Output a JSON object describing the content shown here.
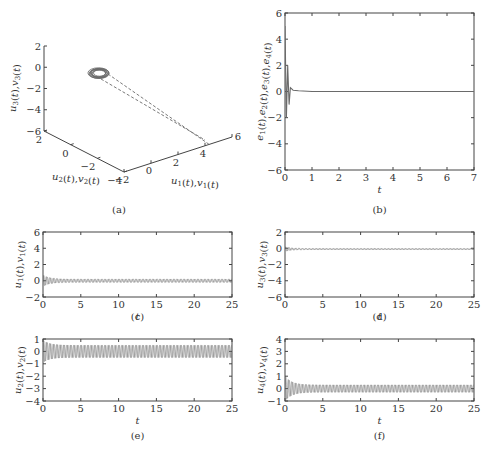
{
  "figure": {
    "background": "#ffffff",
    "axis_color": "#444444",
    "trace_color": "#6a6a6a",
    "panels": [
      "(a)",
      "(b)",
      "(c)",
      "(d)",
      "(e)",
      "(f)"
    ]
  },
  "chart_data": [
    {
      "id": "a",
      "type": "line3d",
      "caption": "(a)",
      "xlabel": "u1(t),v1(t)",
      "ylabel": "u2(t),v2(t)",
      "zlabel": "u3(t),v3(t)",
      "x_ticks": [
        -2,
        0,
        2,
        4,
        6
      ],
      "y_ticks": [
        2,
        0,
        -2,
        -4
      ],
      "z_ticks": [
        2,
        0,
        -2,
        -4,
        -6
      ],
      "xlim": [
        -2,
        6
      ],
      "ylim": [
        -4,
        2
      ],
      "zlim": [
        -6,
        2
      ],
      "description": "Two trajectories start near (5, -3, -6) along dashed paths and converge to a small limit cycle (ring) near (-1, 0, -0.5)",
      "series": [
        {
          "name": "u(t)",
          "style": "dashed",
          "start": [
            5,
            -3,
            -6
          ],
          "attractor_center": [
            -1,
            0,
            -0.4
          ]
        },
        {
          "name": "v(t)",
          "style": "dashed",
          "start": [
            4.8,
            -3.2,
            -5.8
          ],
          "attractor_center": [
            -1,
            0,
            -0.4
          ]
        }
      ]
    },
    {
      "id": "b",
      "type": "line",
      "caption": "(b)",
      "xlabel": "t",
      "ylabel": "e1(t),e2(t),e3(t),e4(t)",
      "xlim": [
        0,
        7
      ],
      "ylim": [
        -6,
        6
      ],
      "x_ticks": [
        0,
        1,
        2,
        3,
        4,
        5,
        6,
        7
      ],
      "y_ticks": [
        -6,
        -4,
        -2,
        0,
        2,
        4,
        6
      ],
      "description": "Synchronization errors spike within t<0.3 (peak ~5, min ~-2) then settle to 0",
      "series": [
        {
          "name": "e(t)",
          "x": [
            0,
            0.05,
            0.1,
            0.15,
            0.2,
            0.3,
            0.5,
            1,
            7
          ],
          "y": [
            5,
            -2,
            2,
            -1,
            0.3,
            0.1,
            0.05,
            0,
            0
          ]
        }
      ]
    },
    {
      "id": "c",
      "type": "line",
      "caption": "(c)",
      "xlabel": "t",
      "ylabel": "u1(t),v1(t)",
      "xlim": [
        0,
        25
      ],
      "ylim": [
        -2,
        6
      ],
      "x_ticks": [
        0,
        5,
        10,
        15,
        20,
        25
      ],
      "y_ticks": [
        -2,
        0,
        2,
        4,
        6
      ],
      "description": "Damped oscillation, initial amplitude ~0.7 decaying to ~0.2 steady oscillation about 0",
      "series": [
        {
          "name": "u1/v1",
          "initial_amplitude": 0.7,
          "steady_amplitude": 0.2,
          "center": 0
        }
      ]
    },
    {
      "id": "d",
      "type": "line",
      "caption": "(d)",
      "xlabel": "t",
      "ylabel": "u3(t),v3(t)",
      "xlim": [
        0,
        25
      ],
      "ylim": [
        -6,
        2
      ],
      "x_ticks": [
        0,
        5,
        10,
        15,
        20,
        25
      ],
      "y_ticks": [
        -6,
        -4,
        -2,
        0,
        2
      ],
      "description": "Small transient near t=0 then near-constant value slightly below 0",
      "series": [
        {
          "name": "u3/v3",
          "initial_amplitude": 0.3,
          "steady_amplitude": 0.05,
          "center": -0.1
        }
      ]
    },
    {
      "id": "e",
      "type": "line",
      "caption": "(e)",
      "xlabel": "t",
      "ylabel": "u2(t),v2(t)",
      "xlim": [
        0,
        25
      ],
      "ylim": [
        -4,
        1
      ],
      "x_ticks": [
        0,
        5,
        10,
        15,
        20,
        25
      ],
      "y_ticks": [
        -4,
        -3,
        -2,
        -1,
        0,
        1
      ],
      "description": "Oscillation with initial amplitude ~0.9 settling to ~0.5 about 0",
      "series": [
        {
          "name": "u2/v2",
          "initial_amplitude": 0.9,
          "steady_amplitude": 0.5,
          "center": 0
        }
      ]
    },
    {
      "id": "f",
      "type": "line",
      "caption": "(f)",
      "xlabel": "t",
      "ylabel": "u4(t),v4(t)",
      "xlim": [
        0,
        25
      ],
      "ylim": [
        -1,
        4
      ],
      "x_ticks": [
        0,
        5,
        10,
        15,
        20,
        25
      ],
      "y_ticks": [
        -1,
        0,
        1,
        2,
        3,
        4
      ],
      "description": "Oscillation with initial amplitude ~1 decaying to ~0.3 about 0",
      "series": [
        {
          "name": "u4/v4",
          "initial_amplitude": 1.0,
          "steady_amplitude": 0.3,
          "center": 0
        }
      ]
    }
  ]
}
